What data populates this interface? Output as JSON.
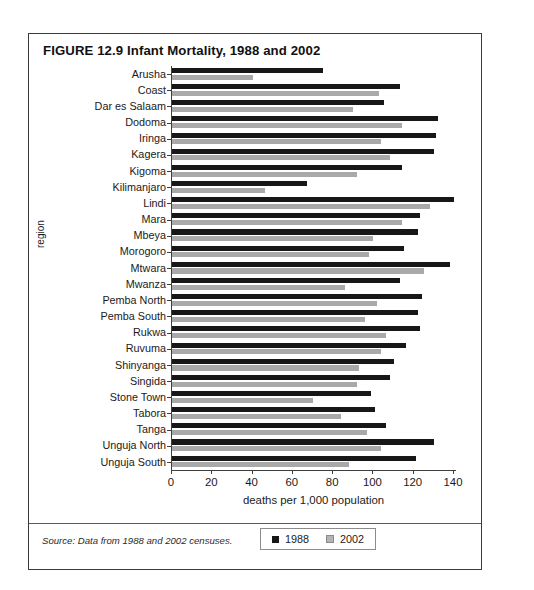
{
  "figure": {
    "caption": "FIGURE 12.9  Infant Mortality, 1988 and 2002",
    "source_note": "Source: Data from 1988 and 2002 censuses."
  },
  "legend": {
    "position": "below-plot",
    "items": [
      {
        "label": "1988",
        "color": "#171717"
      },
      {
        "label": "2002",
        "color": "#b4b4b4"
      }
    ]
  },
  "chart_data": {
    "type": "bar",
    "orientation": "horizontal",
    "title": "FIGURE 12.9  Infant Mortality, 1988 and 2002",
    "xlabel": "deaths per 1,000 population",
    "ylabel": "region",
    "xlim": [
      0,
      140
    ],
    "xticks": [
      0,
      20,
      40,
      60,
      80,
      100,
      120,
      140
    ],
    "grid": false,
    "legend": [
      "1988",
      "2002"
    ],
    "categories": [
      "Arusha",
      "Coast",
      "Dar es Salaam",
      "Dodoma",
      "Iringa",
      "Kagera",
      "Kigoma",
      "Kilimanjaro",
      "Lindi",
      "Mara",
      "Mbeya",
      "Morogoro",
      "Mtwara",
      "Mwanza",
      "Pemba North",
      "Pemba South",
      "Rukwa",
      "Ruvuma",
      "Shinyanga",
      "Singida",
      "Stone Town",
      "Tabora",
      "Tanga",
      "Unguja North",
      "Unguja South"
    ],
    "series": [
      {
        "name": "1988",
        "color": "#171717",
        "values": [
          75,
          113,
          105,
          132,
          131,
          130,
          114,
          67,
          140,
          123,
          122,
          115,
          138,
          113,
          124,
          122,
          123,
          116,
          110,
          108,
          99,
          101,
          106,
          130,
          121
        ]
      },
      {
        "name": "2002",
        "color": "#a9a9a9",
        "values": [
          40,
          103,
          90,
          114,
          104,
          108,
          92,
          46,
          128,
          114,
          100,
          98,
          125,
          86,
          102,
          96,
          106,
          104,
          93,
          92,
          70,
          84,
          97,
          104,
          88
        ]
      }
    ]
  }
}
